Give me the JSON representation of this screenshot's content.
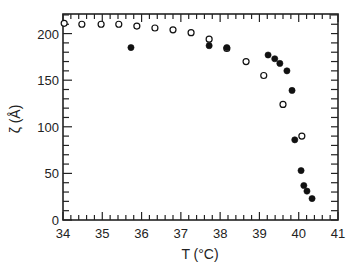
{
  "chart_data": {
    "type": "scatter",
    "title": "",
    "xlabel": "T (°C)",
    "ylabel": "ζ (Å)",
    "xlim": [
      34,
      41
    ],
    "ylim": [
      0,
      221
    ],
    "xticks": [
      34,
      35,
      36,
      37,
      38,
      39,
      40,
      41
    ],
    "yticks": [
      0,
      50,
      100,
      150,
      200
    ],
    "x_minor_step": 0.2,
    "y_minor_step": 10,
    "grid": false,
    "legend": null,
    "series": [
      {
        "name": "open circles",
        "marker": "open-circle",
        "points": [
          [
            34.03,
            211
          ],
          [
            34.48,
            210
          ],
          [
            34.97,
            210
          ],
          [
            35.42,
            210
          ],
          [
            35.88,
            208
          ],
          [
            36.34,
            206
          ],
          [
            36.8,
            204
          ],
          [
            37.26,
            201
          ],
          [
            37.72,
            194
          ],
          [
            38.17,
            184
          ],
          [
            38.66,
            170
          ],
          [
            39.11,
            155
          ],
          [
            39.6,
            124
          ],
          [
            40.08,
            90
          ]
        ]
      },
      {
        "name": "filled circles",
        "marker": "filled-circle",
        "points": [
          [
            35.73,
            185
          ],
          [
            37.72,
            187
          ],
          [
            38.17,
            185
          ],
          [
            39.22,
            177
          ],
          [
            39.39,
            173
          ],
          [
            39.52,
            168
          ],
          [
            39.7,
            160
          ],
          [
            39.83,
            139
          ],
          [
            39.9,
            86
          ],
          [
            40.06,
            53
          ],
          [
            40.13,
            37
          ],
          [
            40.21,
            31
          ],
          [
            40.34,
            23
          ]
        ]
      }
    ]
  },
  "colors": {
    "axis": "#222222",
    "marker": "#111111",
    "background": "#ffffff"
  }
}
